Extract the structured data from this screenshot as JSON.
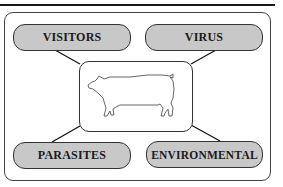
{
  "diagram": {
    "type": "hub-and-spoke",
    "center": {
      "icon": "pig-icon",
      "label": ""
    },
    "nodes": [
      {
        "id": "visitors",
        "label": "VISITORS",
        "position": "top-left"
      },
      {
        "id": "virus",
        "label": "VIRUS",
        "position": "top-right"
      },
      {
        "id": "parasites",
        "label": "PARASITES",
        "position": "bottom-left"
      },
      {
        "id": "environmental",
        "label": "ENVIRONMENTAL",
        "position": "bottom-right"
      }
    ],
    "colors": {
      "node_fill": "#c8c8c8",
      "border": "#333333",
      "line": "#1a1a1a",
      "background": "#ffffff"
    }
  }
}
